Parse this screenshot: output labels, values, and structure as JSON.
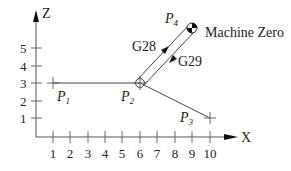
{
  "diagram": {
    "type": "CNC reference return path diagram",
    "axes": {
      "x_label": "X",
      "z_label": "Z",
      "x_ticks": [
        "1",
        "2",
        "3",
        "4",
        "5",
        "6",
        "7",
        "8",
        "9",
        "10"
      ],
      "z_ticks": [
        "1",
        "2",
        "3",
        "4",
        "5"
      ]
    },
    "points": {
      "p1": {
        "name": "P",
        "sub": "1",
        "x": 1,
        "z": 3
      },
      "p2": {
        "name": "P",
        "sub": "2",
        "x": 6,
        "z": 3
      },
      "p3": {
        "name": "P",
        "sub": "3",
        "x": 10,
        "z": 1
      },
      "p4": {
        "name": "P",
        "sub": "4",
        "x": 9,
        "z": 6
      }
    },
    "machine_zero_label": "Machine Zero",
    "commands": {
      "g28": "G28",
      "g29": "G29"
    },
    "colors": {
      "line": "#444444",
      "text": "#222222",
      "background": "#ffffff"
    }
  }
}
